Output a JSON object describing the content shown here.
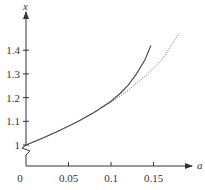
{
  "chart_data": {
    "type": "line",
    "title": "",
    "xlabel": "a",
    "ylabel": "x",
    "xlim": [
      0,
      0.19
    ],
    "ylim": [
      0.9,
      1.5
    ],
    "y_axis_break": true,
    "grid": false,
    "legend": null,
    "x_ticks": [
      {
        "value": 0,
        "label": "0"
      },
      {
        "value": 0.05,
        "label": "0.05"
      },
      {
        "value": 0.1,
        "label": "0.1"
      },
      {
        "value": 0.15,
        "label": "0.15"
      }
    ],
    "y_ticks": [
      {
        "value": 1.0,
        "label": "1"
      },
      {
        "value": 1.1,
        "label": "1.1"
      },
      {
        "value": 1.2,
        "label": "1.2"
      },
      {
        "value": 1.3,
        "label": "1.3"
      },
      {
        "value": 1.4,
        "label": "1.4"
      }
    ],
    "series": [
      {
        "name": "exact",
        "style": "solid",
        "color": "#444444",
        "x": [
          0,
          0.02,
          0.04,
          0.06,
          0.08,
          0.1,
          0.11,
          0.12,
          0.13,
          0.14,
          0.147
        ],
        "y": [
          1.0,
          1.03,
          1.062,
          1.097,
          1.137,
          1.185,
          1.215,
          1.252,
          1.3,
          1.36,
          1.42
        ]
      },
      {
        "name": "approximation",
        "style": "dotted",
        "color": "#666666",
        "x": [
          0,
          0.02,
          0.04,
          0.06,
          0.08,
          0.1,
          0.12,
          0.14,
          0.16,
          0.18
        ],
        "y": [
          1.0,
          1.03,
          1.062,
          1.097,
          1.137,
          1.18,
          1.23,
          1.29,
          1.36,
          1.47
        ]
      }
    ]
  },
  "axes": {
    "x_name": "a",
    "y_name": "x",
    "origin_label": "0"
  }
}
